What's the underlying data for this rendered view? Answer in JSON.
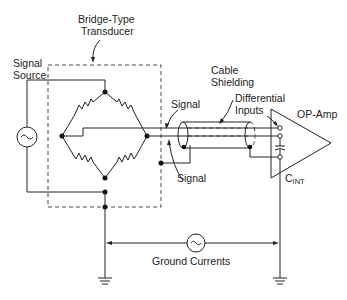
{
  "diagram": {
    "labels": {
      "bridge_type": "Bridge-Type",
      "transducer": "Transducer",
      "signal_source_1": "Signal",
      "signal_source_2": "Source",
      "signal_top": "Signal",
      "signal_bottom": "Signal",
      "cable_1": "Cable",
      "cable_2": "Shielding",
      "diff_1": "Differential",
      "diff_2": "Inputs",
      "opamp": "OP-Amp",
      "cint_main": "C",
      "cint_sub": "INT",
      "ground_currents": "Ground Currents"
    },
    "symbols": {
      "source": "~",
      "ground_source": "~"
    },
    "colors": {
      "line": "#222222",
      "background": "#ffffff"
    }
  }
}
